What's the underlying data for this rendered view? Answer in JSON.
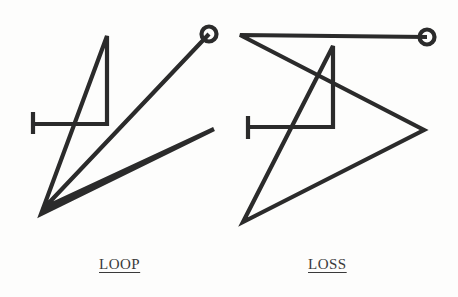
{
  "page": {
    "background_color": "#fdfdfc",
    "ink_color": "#2b2b2b",
    "caption_color": "#3a3a3a",
    "width": 458,
    "height": 297
  },
  "figures": [
    {
      "id": "loop",
      "caption": "LOOP",
      "description": "Single continuous angular line drawing with a small open circle terminal at upper right, a T-shaped bar terminal at mid left, and a narrow elongated wedge at lower right.",
      "stroke_width": 4.2,
      "circle_terminal": {
        "cx": 209,
        "cy": 34,
        "r": 7.5,
        "stroke_width": 4.2
      },
      "tbar_terminal": {
        "x": 33,
        "y_top": 112,
        "y_bottom": 134,
        "stroke_width": 4.2
      },
      "polyline_points": "33,124 107,124 107,36 41,214 214,129 44,208 209,34",
      "segments": [
        {
          "name": "tbar-horizontal",
          "from": [
            33,
            124
          ],
          "to": [
            107,
            124
          ]
        },
        {
          "name": "vertical-right",
          "from": [
            107,
            124
          ],
          "to": [
            107,
            36
          ]
        },
        {
          "name": "long-diagonal-down-left",
          "from": [
            107,
            36
          ],
          "to": [
            41,
            214
          ]
        },
        {
          "name": "wedge-up-right",
          "from": [
            41,
            214
          ],
          "to": [
            214,
            129
          ]
        },
        {
          "name": "wedge-back-down-left",
          "from": [
            214,
            129
          ],
          "to": [
            44,
            208
          ]
        },
        {
          "name": "diagonal-up-to-circle",
          "from": [
            44,
            208
          ],
          "to": [
            209,
            34
          ]
        }
      ]
    },
    {
      "id": "loss",
      "caption": "LOSS",
      "description": "Single continuous angular line drawing with a small open circle terminal at upper right, a T-shaped bar terminal at mid left, a wide triangular sweep to a right vertex, and a lower left vertex.",
      "stroke_width": 4.2,
      "circle_terminal": {
        "cx": 427,
        "cy": 37,
        "r": 7.5,
        "stroke_width": 4.2
      },
      "tbar_terminal": {
        "x": 248,
        "y_top": 116,
        "y_bottom": 139,
        "stroke_width": 4.2
      },
      "polyline_points": "248,127 333,127 333,46 243,222 424,130 240,35 427,37",
      "segments": [
        {
          "name": "tbar-horizontal",
          "from": [
            248,
            127
          ],
          "to": [
            333,
            127
          ]
        },
        {
          "name": "vertical-right",
          "from": [
            333,
            127
          ],
          "to": [
            333,
            46
          ]
        },
        {
          "name": "long-diagonal-down-left",
          "from": [
            333,
            46
          ],
          "to": [
            243,
            222
          ]
        },
        {
          "name": "diagonal-up-right-to-vertex",
          "from": [
            243,
            222
          ],
          "to": [
            424,
            130
          ]
        },
        {
          "name": "diagonal-up-left-to-corner",
          "from": [
            424,
            130
          ],
          "to": [
            240,
            35
          ]
        },
        {
          "name": "top-horizontal-to-circle",
          "from": [
            240,
            35
          ],
          "to": [
            427,
            37
          ]
        }
      ]
    }
  ]
}
